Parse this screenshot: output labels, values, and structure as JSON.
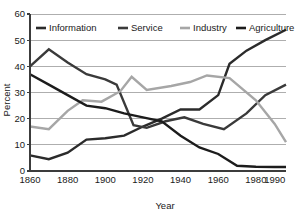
{
  "chart_data": {
    "type": "line",
    "title": "",
    "xlabel": "Year",
    "ylabel": "Percent",
    "xlim": [
      1860,
      1996
    ],
    "ylim": [
      0,
      60
    ],
    "xticks": [
      1860,
      1880,
      1900,
      1920,
      1940,
      1960,
      1980,
      1990
    ],
    "xtick_labels": [
      "1860",
      "1880",
      "1900",
      "1920",
      "1940",
      "1960",
      "1980",
      "1990"
    ],
    "yticks": [
      0,
      10,
      20,
      30,
      40,
      50,
      60
    ],
    "ytick_labels": [
      "0",
      "10",
      "20",
      "30",
      "40",
      "50",
      "60"
    ],
    "grid": "horizontal",
    "legend_position": "top",
    "series": [
      {
        "name": "Information",
        "color": "#2b2b2b",
        "x": [
          1860,
          1870,
          1880,
          1890,
          1900,
          1910,
          1920,
          1930,
          1940,
          1950,
          1960,
          1966,
          1975,
          1985,
          1996
        ],
        "values": [
          6,
          4.5,
          7,
          12,
          12.5,
          13.5,
          17,
          20,
          23.5,
          23.5,
          29,
          41,
          46,
          50,
          54
        ]
      },
      {
        "name": "Service",
        "color": "#3a3a3a",
        "x": [
          1860,
          1870,
          1880,
          1890,
          1900,
          1906,
          1915,
          1922,
          1932,
          1942,
          1952,
          1963,
          1975,
          1985,
          1996
        ],
        "values": [
          40,
          46.5,
          41.5,
          37,
          35,
          33,
          17.5,
          16.5,
          19,
          20.5,
          18,
          16,
          22,
          29,
          33
        ]
      },
      {
        "name": "Industry",
        "color": "#a6a6a6",
        "x": [
          1860,
          1870,
          1880,
          1888,
          1898,
          1908,
          1914,
          1922,
          1935,
          1945,
          1954,
          1966,
          1980,
          1990,
          1996
        ],
        "values": [
          17,
          16,
          23,
          27,
          26.5,
          30.5,
          36,
          31,
          32.5,
          34,
          36.5,
          35.5,
          27,
          18,
          11
        ]
      },
      {
        "name": "Agriculture",
        "color": "#1c1c1c",
        "x": [
          1860,
          1870,
          1880,
          1890,
          1900,
          1910,
          1920,
          1930,
          1940,
          1950,
          1960,
          1970,
          1980,
          1990,
          1996
        ],
        "values": [
          37,
          33,
          29,
          25,
          24,
          22,
          20.5,
          19,
          13.5,
          9,
          6.5,
          2,
          1.6,
          1.5,
          1.5
        ]
      }
    ],
    "legend": [
      {
        "label": "Information",
        "color": "#2b2b2b"
      },
      {
        "label": "Service",
        "color": "#3a3a3a"
      },
      {
        "label": "Industry",
        "color": "#a6a6a6"
      },
      {
        "label": "Agriculture",
        "color": "#1c1c1c"
      }
    ]
  }
}
